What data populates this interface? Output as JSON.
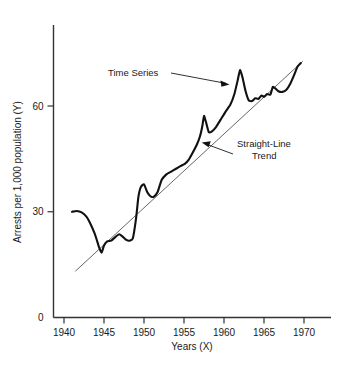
{
  "chart_data": {
    "type": "line",
    "title": "",
    "xlabel": "Years (X)",
    "ylabel": "Arrests per 1,000 population (Y)",
    "xlim": [
      1938.6,
      1973.2
    ],
    "ylim": [
      0,
      79
    ],
    "grid": false,
    "legend_position": "none",
    "xticks": [
      1940,
      1945,
      1950,
      1955,
      1960,
      1965,
      1970
    ],
    "xtick_labels": [
      "1940",
      "1945",
      "1950",
      "1955",
      "1960",
      "1965",
      "1970"
    ],
    "yticks": [
      0,
      30,
      60
    ],
    "ytick_labels": [
      "0",
      "30",
      "60"
    ],
    "series": [
      {
        "name": "Time Series",
        "color": "#111111",
        "width": 2.1,
        "x": [
          1941.0,
          1941.6,
          1942.2,
          1942.8,
          1943.3,
          1943.8,
          1944.1,
          1944.4,
          1944.7,
          1945.0,
          1945.4,
          1945.9,
          1946.4,
          1946.9,
          1947.3,
          1947.8,
          1948.2,
          1948.6,
          1949.0,
          1949.3,
          1949.6,
          1950.0,
          1950.4,
          1950.8,
          1951.2,
          1951.7,
          1952.2,
          1952.8,
          1953.4,
          1954.0,
          1954.6,
          1955.1,
          1955.6,
          1956.1,
          1956.6,
          1957.0,
          1957.3,
          1957.5,
          1957.8,
          1958.1,
          1958.5,
          1959.0,
          1959.6,
          1960.2,
          1960.8,
          1961.3,
          1961.7,
          1962.0,
          1962.3,
          1962.7,
          1963.1,
          1963.5,
          1963.9,
          1964.3,
          1964.7,
          1965.0,
          1965.4,
          1965.8,
          1966.1,
          1966.4,
          1966.8,
          1967.3,
          1967.8,
          1968.3,
          1968.8,
          1969.2,
          1969.6
        ],
        "y": [
          30.0,
          30.2,
          29.8,
          28.6,
          26.6,
          24.0,
          22.0,
          19.8,
          18.4,
          20.4,
          21.6,
          21.8,
          22.8,
          23.6,
          23.0,
          22.0,
          21.8,
          22.4,
          28.0,
          34.2,
          37.0,
          37.8,
          35.6,
          34.4,
          34.2,
          35.6,
          39.0,
          40.6,
          41.4,
          42.2,
          43.0,
          43.6,
          44.8,
          46.8,
          49.0,
          51.4,
          54.4,
          57.2,
          55.0,
          52.6,
          52.8,
          54.0,
          56.2,
          58.4,
          60.4,
          63.4,
          67.2,
          70.2,
          68.2,
          64.2,
          61.6,
          61.4,
          62.2,
          62.0,
          63.0,
          62.6,
          63.4,
          63.2,
          65.4,
          65.0,
          64.2,
          64.0,
          64.6,
          66.4,
          69.0,
          71.2,
          72.2
        ]
      },
      {
        "name": "Straight-Line Trend",
        "color": "#555555",
        "width": 0.9,
        "x": [
          1941.45,
          1969.8
        ],
        "y": [
          13.2,
          72.6
        ]
      }
    ],
    "annotations": [
      {
        "name": "time-series-callout",
        "text": "Time Series",
        "text_x": 108,
        "text_y": 76,
        "leader": [
          [
            171,
            73
          ],
          [
            228,
            84
          ]
        ],
        "arrow_at": [
          228,
          84
        ],
        "arrow_dir": "right-down"
      },
      {
        "name": "straight-line-trend-callout",
        "text_line_1": "Straight-Line",
        "text_line_2": "Trend",
        "text_x": 237,
        "text_y": 147,
        "leader": [
          [
            232,
            153
          ],
          [
            202,
            143
          ]
        ],
        "arrow_at": [
          202,
          143
        ],
        "arrow_dir": "left-up"
      }
    ]
  },
  "axes": {
    "x_title": "Years (X)",
    "y_title": "Arrests per 1,000 population (Y)",
    "axis_color": "#333333"
  }
}
